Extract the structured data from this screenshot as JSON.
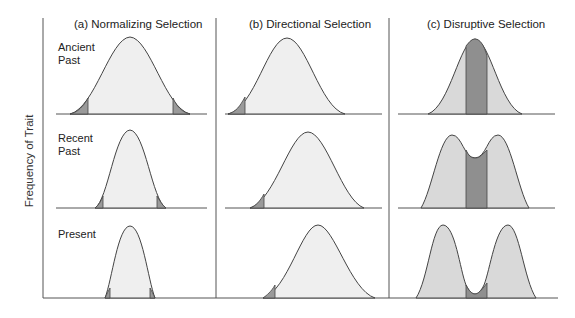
{
  "figure": {
    "y_axis_label": "Frequency of Trait",
    "panels": [
      {
        "id": "a",
        "title": "(a)  Normalizing Selection"
      },
      {
        "id": "b",
        "title": "(b)  Directional Selection"
      },
      {
        "id": "c",
        "title": "(c)  Disruptive Selection"
      }
    ],
    "rows": [
      {
        "label_line1": "Ancient",
        "label_line2": "Past"
      },
      {
        "label_line1": "Recent",
        "label_line2": "Past"
      },
      {
        "label_line1": "Present",
        "label_line2": ""
      }
    ],
    "colors": {
      "curve_fill": "#efefef",
      "selected_fill": "#9a9a9a",
      "disruptive_fill": "#d9d9d9",
      "disruptive_center": "#8f8f8f",
      "line": "#444444"
    }
  }
}
